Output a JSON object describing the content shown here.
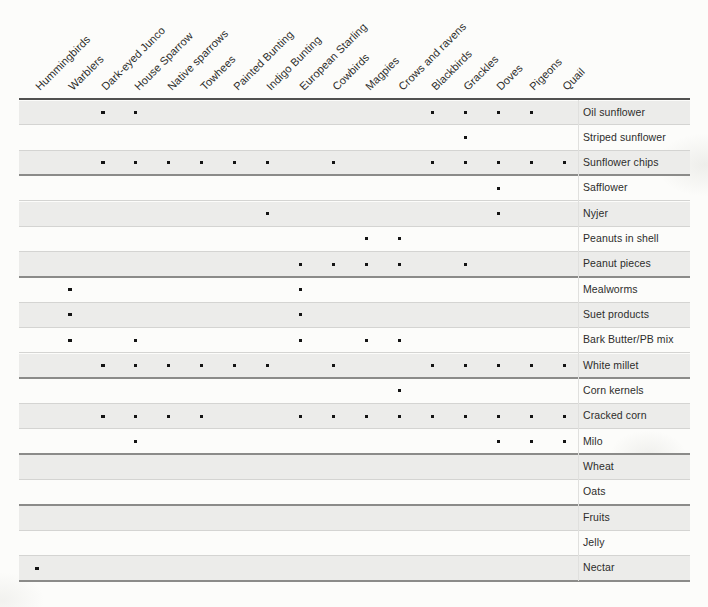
{
  "colors": {
    "band_shaded": "#ececea",
    "row_line": "#d4d4d2",
    "group_line": "#8b8b89",
    "header_line": "#515150",
    "dot": "#141414",
    "text": "#2d2d2b"
  },
  "chart_data": {
    "type": "heatmap",
    "title": "",
    "note": "Matrix of bird species vs. bird food types; a dot marks that the species eats that food",
    "columns": [
      "Hummingbirds",
      "Warblers",
      "Dark-eyed Junco",
      "House Sparrow",
      "Native sparrows",
      "Towhees",
      "Painted Bunting",
      "Indigo Bunting",
      "European Starling",
      "Cowbirds",
      "Magpies",
      "Crows and ravens",
      "Blackbirds",
      "Grackles",
      "Doves",
      "Pigeons",
      "Quail"
    ],
    "rows": [
      {
        "label": "Oil sunflower",
        "eaten_by": [
          "Dark-eyed Junco",
          "House Sparrow",
          "Blackbirds",
          "Grackles",
          "Doves",
          "Pigeons"
        ]
      },
      {
        "label": "Striped sunflower",
        "eaten_by": [
          "Grackles"
        ]
      },
      {
        "label": "Sunflower chips",
        "eaten_by": [
          "Dark-eyed Junco",
          "House Sparrow",
          "Native sparrows",
          "Towhees",
          "Painted Bunting",
          "Indigo Bunting",
          "Cowbirds",
          "Blackbirds",
          "Grackles",
          "Doves",
          "Pigeons",
          "Quail"
        ]
      },
      {
        "label": "Safflower",
        "eaten_by": [
          "Doves"
        ]
      },
      {
        "label": "Nyjer",
        "eaten_by": [
          "Indigo Bunting",
          "Doves"
        ]
      },
      {
        "label": "Peanuts in shell",
        "eaten_by": [
          "Magpies",
          "Crows and ravens"
        ]
      },
      {
        "label": "Peanut pieces",
        "eaten_by": [
          "European Starling",
          "Cowbirds",
          "Magpies",
          "Crows and ravens",
          "Grackles"
        ]
      },
      {
        "label": "Mealworms",
        "eaten_by": [
          "Warblers",
          "European Starling"
        ]
      },
      {
        "label": "Suet products",
        "eaten_by": [
          "Warblers",
          "European Starling"
        ]
      },
      {
        "label": "Bark Butter/PB mix",
        "eaten_by": [
          "Warblers",
          "House Sparrow",
          "European Starling",
          "Magpies",
          "Crows and ravens"
        ]
      },
      {
        "label": "White millet",
        "eaten_by": [
          "Dark-eyed Junco",
          "House Sparrow",
          "Native sparrows",
          "Towhees",
          "Painted Bunting",
          "Indigo Bunting",
          "Cowbirds",
          "Blackbirds",
          "Grackles",
          "Doves",
          "Pigeons",
          "Quail"
        ]
      },
      {
        "label": "Corn kernels",
        "eaten_by": [
          "Crows and ravens"
        ]
      },
      {
        "label": "Cracked corn",
        "eaten_by": [
          "Dark-eyed Junco",
          "House Sparrow",
          "Native sparrows",
          "Towhees",
          "European Starling",
          "Cowbirds",
          "Magpies",
          "Crows and ravens",
          "Blackbirds",
          "Grackles",
          "Doves",
          "Pigeons",
          "Quail"
        ]
      },
      {
        "label": "Milo",
        "eaten_by": [
          "House Sparrow",
          "Doves",
          "Pigeons",
          "Quail"
        ]
      },
      {
        "label": "Wheat",
        "eaten_by": []
      },
      {
        "label": "Oats",
        "eaten_by": []
      },
      {
        "label": "Fruits",
        "eaten_by": []
      },
      {
        "label": "Jelly",
        "eaten_by": []
      },
      {
        "label": "Nectar",
        "eaten_by": [
          "Hummingbirds"
        ]
      }
    ],
    "group_separators_after": [
      "Sunflower chips",
      "Peanut pieces",
      "White millet",
      "Milo",
      "Oats",
      "Nectar"
    ],
    "shading": "alternating rows, first row shaded",
    "legend_position": "none",
    "grid": "horizontal rules only"
  }
}
